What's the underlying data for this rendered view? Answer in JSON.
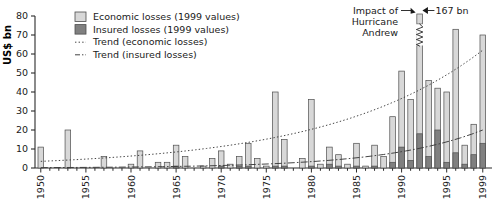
{
  "chart_data": {
    "type": "bar",
    "title": "",
    "xlabel": "",
    "ylabel": "US$ bn",
    "ylim": [
      0,
      80
    ],
    "ytick_values": [
      0,
      10,
      20,
      30,
      40,
      50,
      60,
      70,
      80
    ],
    "ytick_labels": [
      "0",
      "10",
      "20",
      "30",
      "40",
      "50",
      "60",
      "70",
      "80"
    ],
    "grid": false,
    "legend_position": "top-left",
    "stacked": true,
    "x": [
      1950,
      1951,
      1952,
      1953,
      1954,
      1955,
      1956,
      1957,
      1958,
      1959,
      1960,
      1961,
      1962,
      1963,
      1964,
      1965,
      1966,
      1967,
      1968,
      1969,
      1970,
      1971,
      1972,
      1973,
      1974,
      1975,
      1976,
      1977,
      1978,
      1979,
      1980,
      1981,
      1982,
      1983,
      1984,
      1985,
      1986,
      1987,
      1988,
      1989,
      1990,
      1991,
      1992,
      1993,
      1994,
      1995,
      1996,
      1997,
      1998,
      1999
    ],
    "xtick_labels": [
      "1950",
      "1955",
      "1960",
      "1965",
      "1970",
      "1975",
      "1980",
      "1985",
      "1990",
      "1995",
      "1999"
    ],
    "xtick_values": [
      1950,
      1955,
      1960,
      1965,
      1970,
      1975,
      1980,
      1985,
      1990,
      1995,
      1999
    ],
    "series": [
      {
        "name": "Economic losses (1999 values)",
        "color": "#d8d8d8",
        "values": [
          11,
          0,
          0,
          20,
          0,
          0,
          0,
          6,
          0,
          0,
          2,
          9,
          0,
          3,
          3,
          12,
          6,
          0,
          1,
          5,
          9,
          2,
          6,
          13,
          5,
          1,
          40,
          15,
          0,
          5,
          36,
          2,
          11,
          7,
          2,
          13,
          1,
          12,
          6,
          27,
          51,
          36,
          72,
          46,
          42,
          40,
          73,
          12,
          23,
          70
        ]
      },
      {
        "name": "Insured losses (1999 values)",
        "color": "#808080",
        "values": [
          0,
          0,
          0,
          0,
          0,
          0,
          0,
          0,
          0,
          0,
          0,
          0,
          0,
          0,
          0,
          1,
          0,
          0,
          0,
          0,
          1,
          0,
          1,
          1,
          0,
          0,
          1,
          1,
          0,
          0,
          1,
          0,
          2,
          1,
          0,
          1,
          0,
          1,
          0,
          3,
          11,
          4,
          18,
          6,
          20,
          3,
          8,
          2,
          7,
          13
        ]
      }
    ],
    "trends": [
      {
        "name": "Trend (economic losses)",
        "style": "dotted",
        "color": "#3a3a3a",
        "start": [
          1950,
          3.5
        ],
        "end": [
          1999,
          62
        ]
      },
      {
        "name": "Trend (insured losses)",
        "style": "dashdot",
        "color": "#3a3a3a",
        "start": [
          1950,
          0.2
        ],
        "end": [
          1999,
          20
        ]
      }
    ],
    "annotations": [
      {
        "name": "hurricane-andrew",
        "text": "Impact of\nHurricane\nAndrew",
        "target_year": 1992
      },
      {
        "name": "value-167",
        "text": "167 bn",
        "target_year": 1992
      }
    ],
    "axis_break": {
      "year": 1992,
      "note": "bar truncated with break symbol"
    }
  },
  "legend": {
    "items": [
      {
        "label": "Economic losses (1999 values)",
        "marker": "swatch-light"
      },
      {
        "label": "Insured losses (1999 values)",
        "marker": "swatch-dark"
      },
      {
        "label": "Trend (economic losses)",
        "marker": "line-dotted"
      },
      {
        "label": "Trend (insured losses)",
        "marker": "line-dashdot"
      }
    ]
  },
  "annotation": {
    "line1": "Impact of",
    "line2": "Hurricane",
    "line3": "Andrew",
    "value": "167 bn"
  },
  "colors": {
    "economic": "#d8d8d8",
    "insured": "#808080",
    "stroke": "#4d4d4d",
    "axis": "#2b2b2b",
    "text": "#1a1a1a"
  }
}
